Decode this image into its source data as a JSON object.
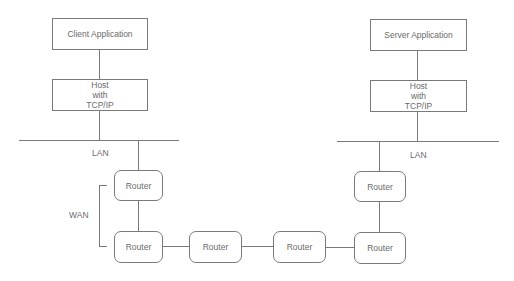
{
  "diagram": {
    "client_app": {
      "label": "Client Application"
    },
    "client_host": {
      "lines": [
        "Host",
        "with",
        "TCP/IP"
      ]
    },
    "server_app": {
      "label": "Server Application"
    },
    "server_host": {
      "lines": [
        "Host",
        "with",
        "TCP/IP"
      ]
    },
    "lan_left": {
      "label": "LAN"
    },
    "lan_right": {
      "label": "LAN"
    },
    "wan": {
      "label": "WAN"
    },
    "routers": [
      {
        "label": "Router"
      },
      {
        "label": "Router"
      },
      {
        "label": "Router"
      },
      {
        "label": "Router"
      },
      {
        "label": "Router"
      },
      {
        "label": "Router"
      }
    ],
    "colors": {
      "line": "#7a7a7a",
      "text": "#6a6a6a",
      "background": "#ffffff"
    }
  }
}
